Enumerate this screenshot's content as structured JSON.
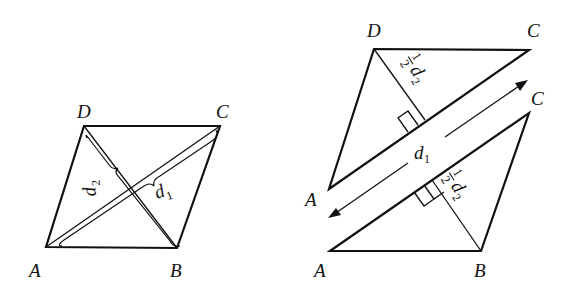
{
  "figure": {
    "left": {
      "title": "Rhombus ABCD with diagonals",
      "vertices": {
        "A": "A",
        "B": "B",
        "C": "C",
        "D": "D"
      },
      "diagonal_labels": {
        "d1": "d",
        "d1_sub": "1",
        "d2": "d",
        "d2_sub": "2"
      }
    },
    "right": {
      "title": "Rhombus cut along diagonal AC into two triangles",
      "upper_triangle": {
        "A": "A",
        "C": "C",
        "D": "D",
        "height_label_num": "1",
        "height_label_den": "2",
        "height_label_var": "d",
        "height_label_sub": "2"
      },
      "lower_triangle": {
        "A": "A",
        "B": "B",
        "C": "C",
        "height_label_num": "1",
        "height_label_den": "2",
        "height_label_var": "d",
        "height_label_sub": "2"
      },
      "arrow_label": "d",
      "arrow_label_sub": "1"
    },
    "colors": {
      "stroke": "#111111",
      "background": "#ffffff"
    }
  }
}
